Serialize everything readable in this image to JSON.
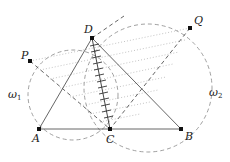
{
  "diagram": {
    "points": [
      {
        "name": "A",
        "x": 39,
        "y": 129,
        "label_dx": -6,
        "label_dy": 12
      },
      {
        "name": "B",
        "x": 181,
        "y": 129,
        "label_dx": 5,
        "label_dy": 10
      },
      {
        "name": "C",
        "x": 110,
        "y": 129,
        "label_dx": -3,
        "label_dy": 14
      },
      {
        "name": "D",
        "x": 92,
        "y": 38,
        "label_dx": -8,
        "label_dy": -5
      },
      {
        "name": "P",
        "x": 30,
        "y": 61,
        "label_dx": -9,
        "label_dy": -3
      },
      {
        "name": "Q",
        "x": 190,
        "y": 28,
        "label_dx": 3,
        "label_dy": -4
      }
    ],
    "circles": [
      {
        "name": "omega_1",
        "label": "ω",
        "subscript": "1",
        "label_x": 8,
        "label_y": 98
      },
      {
        "name": "omega_2",
        "label": "ω",
        "subscript": "2",
        "label_x": 208,
        "label_y": 96
      }
    ],
    "labels": {
      "A": "A",
      "B": "B",
      "C": "C",
      "D": "D",
      "P": "P",
      "Q": "Q",
      "omega": "ω",
      "sub1": "1",
      "sub2": "2"
    },
    "segments_solid": [
      "AB",
      "AD",
      "DB"
    ],
    "segments_dashed": [
      "PC",
      "QC",
      "DQ"
    ],
    "segment_hatched": "DC",
    "dotted_family": "lines parallel to PQ between PD/DQ and DC",
    "colors": {
      "line": "#555555",
      "point": "#111111",
      "dashed": "#777777",
      "dotted": "#aaaaaa"
    }
  }
}
